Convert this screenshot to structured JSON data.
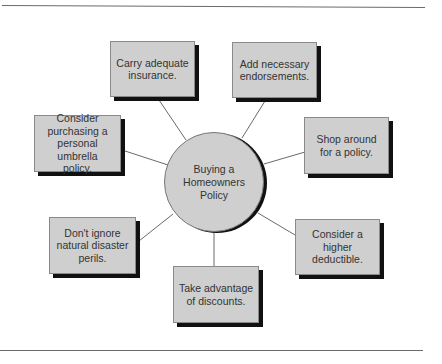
{
  "diagram": {
    "type": "hub-and-spoke",
    "center": {
      "label": "Buying a\nHomeowners\nPolicy"
    },
    "nodes": [
      {
        "id": "carry-insurance",
        "label": "Carry adequate\ninsurance."
      },
      {
        "id": "add-endorsements",
        "label": "Add necessary\nendorsements."
      },
      {
        "id": "umbrella-policy",
        "label": "Consider\npurchasing a\npersonal umbrella\npolicy."
      },
      {
        "id": "shop-around",
        "label": "Shop around\nfor a policy."
      },
      {
        "id": "disaster-perils",
        "label": "Don't ignore\nnatural disaster\nperils."
      },
      {
        "id": "discounts",
        "label": "Take advantage\nof discounts."
      },
      {
        "id": "higher-deductible",
        "label": "Consider a\nhigher\ndeductible."
      }
    ],
    "colors": {
      "box_fill": "#cfcfcf",
      "shadow": "#111111",
      "connector": "#6a6a6a",
      "text": "#333333"
    }
  }
}
